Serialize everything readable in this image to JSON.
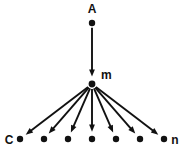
{
  "diagram": {
    "type": "radial-tree",
    "background_color": "#ffffff",
    "ink_color": "#111111",
    "canvas": {
      "width": 183,
      "height": 155
    },
    "nodes": [
      {
        "id": "A",
        "label": "A",
        "role": "source",
        "x": 92,
        "y": 23,
        "label_x": 92,
        "label_y": 13,
        "label_anchor": "middle",
        "radius": 3.2
      },
      {
        "id": "m",
        "label": "m",
        "role": "hub",
        "x": 92,
        "y": 84,
        "label_x": 101,
        "label_y": 79,
        "label_anchor": "start",
        "radius": 3.4
      },
      {
        "id": "C",
        "label": "C",
        "role": "leaf",
        "x": 20,
        "y": 139,
        "label_x": 9,
        "label_y": 144,
        "label_anchor": "middle",
        "radius": 3.2
      },
      {
        "id": "L2",
        "label": "",
        "role": "leaf",
        "x": 44,
        "y": 139,
        "label_x": 44,
        "label_y": 139,
        "label_anchor": "middle",
        "radius": 3.2
      },
      {
        "id": "L3",
        "label": "",
        "role": "leaf",
        "x": 68,
        "y": 139,
        "label_x": 68,
        "label_y": 139,
        "label_anchor": "middle",
        "radius": 3.2
      },
      {
        "id": "L4",
        "label": "",
        "role": "leaf",
        "x": 92,
        "y": 139,
        "label_x": 92,
        "label_y": 139,
        "label_anchor": "middle",
        "radius": 3.2
      },
      {
        "id": "L5",
        "label": "",
        "role": "leaf",
        "x": 116,
        "y": 139,
        "label_x": 116,
        "label_y": 139,
        "label_anchor": "middle",
        "radius": 3.2
      },
      {
        "id": "L6",
        "label": "",
        "role": "leaf",
        "x": 140,
        "y": 139,
        "label_x": 140,
        "label_y": 139,
        "label_anchor": "middle",
        "radius": 3.2
      },
      {
        "id": "n",
        "label": "n",
        "role": "leaf",
        "x": 164,
        "y": 139,
        "label_x": 175,
        "label_y": 144,
        "label_anchor": "middle",
        "radius": 3.2
      }
    ],
    "edges": [
      {
        "id": "edge-A-m",
        "from": "A",
        "to": "m",
        "arrow": true
      },
      {
        "id": "edge-m-C",
        "from": "m",
        "to": "C",
        "arrow": true
      },
      {
        "id": "edge-m-L2",
        "from": "m",
        "to": "L2",
        "arrow": true
      },
      {
        "id": "edge-m-L3",
        "from": "m",
        "to": "L3",
        "arrow": true
      },
      {
        "id": "edge-m-L4",
        "from": "m",
        "to": "L4",
        "arrow": true
      },
      {
        "id": "edge-m-L5",
        "from": "m",
        "to": "L5",
        "arrow": true
      },
      {
        "id": "edge-m-L6",
        "from": "m",
        "to": "L6",
        "arrow": true
      },
      {
        "id": "edge-m-n",
        "from": "m",
        "to": "n",
        "arrow": true
      }
    ],
    "labels": {
      "source": "A",
      "hub": "m",
      "leaf_first": "C",
      "leaf_last": "n"
    }
  }
}
